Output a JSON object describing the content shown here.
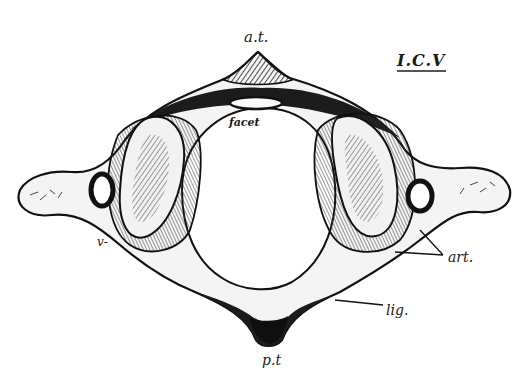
{
  "figure": {
    "title": "I.C.V",
    "labels": {
      "anterior_tubercle": "a.t.",
      "facet": "facet",
      "articular": "art.",
      "vertebral": "v-",
      "ligament": "lig.",
      "posterior_tubercle": "p.t"
    },
    "colors": {
      "ink": "#1a1a1a",
      "paper": "#ffffff",
      "shade": "#3a3a3a"
    }
  }
}
